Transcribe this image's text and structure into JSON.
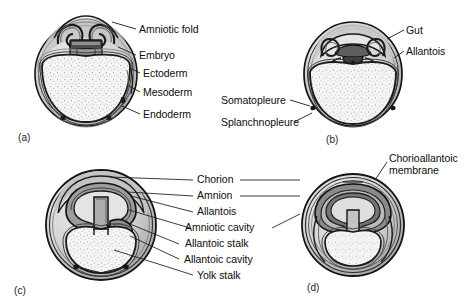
{
  "figure": {
    "background_color": "#ffffff",
    "ink_color": "#111111",
    "width": 473,
    "height": 307
  },
  "panels": [
    {
      "id": "a",
      "letter": "(a)",
      "description": "Early embryo with rising amniotic folds over the embryo, showing the three germ layers enclosing a large yolk mass.",
      "labels": [
        {
          "name": "amniotic-fold",
          "text": "Amniotic fold"
        },
        {
          "name": "embryo",
          "text": "Embryo"
        },
        {
          "name": "ectoderm",
          "text": "Ectoderm"
        },
        {
          "name": "mesoderm",
          "text": "Mesoderm"
        },
        {
          "name": "endoderm",
          "text": "Endoderm"
        }
      ]
    },
    {
      "id": "b",
      "letter": "(b)",
      "description": "Amniotic folds meeting above the embryo; gut and allantois forming, somatopleure and splanchnopleure distinguished.",
      "labels": [
        {
          "name": "gut",
          "text": "Gut"
        },
        {
          "name": "allantois",
          "text": "Allantois"
        },
        {
          "name": "somatopleure",
          "text": "Somatopleure"
        },
        {
          "name": "splanchnopleure",
          "text": "Splanchnopleure"
        }
      ]
    },
    {
      "id": "c",
      "letter": "(c)",
      "description": "Chorion and amnion fully formed; allantois expanded into the extraembryonic coelom; yolk sac narrowing to a yolk stalk.",
      "labels": [
        {
          "name": "chorion",
          "text": "Chorion"
        },
        {
          "name": "amnion",
          "text": "Amnion"
        },
        {
          "name": "allantois",
          "text": "Allantois"
        },
        {
          "name": "amniotic-cavity",
          "text": "Amniotic cavity"
        },
        {
          "name": "allantoic-stalk",
          "text": "Allantoic stalk"
        },
        {
          "name": "allantoic-cavity",
          "text": "Allantoic cavity"
        },
        {
          "name": "yolk-stalk",
          "text": "Yolk stalk"
        }
      ]
    },
    {
      "id": "d",
      "letter": "(d)",
      "description": "Late stage: allantois fused with chorion forming the chorioallantoic membrane lining the shell.",
      "labels": [
        {
          "name": "chorioallantoic-membrane",
          "text": "Chorioallantoic",
          "text2": "membrane"
        }
      ]
    }
  ],
  "palette": {
    "outline": "#141414",
    "yolk_fill": "#f2f2f0",
    "yolk_speckle": "#555555",
    "cavity_light": "#d8d8d6",
    "tissue_mid": "#a8a8a6",
    "tissue_dark": "#8a8a88",
    "tissue_darker": "#6e6e6c",
    "leader_line": "#1a1a1a"
  }
}
